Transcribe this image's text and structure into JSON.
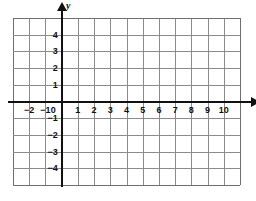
{
  "figure": {
    "kind": "cartesian-coordinate-grid",
    "background_color": "#ffffff",
    "grid_color": "#8b8b8b",
    "axis_color": "#111111"
  },
  "axes": {
    "x_label": "x",
    "y_label": "y",
    "origin_label": "0"
  },
  "chart_data": {
    "type": "scatter",
    "title": "",
    "subtitle": "",
    "xlabel": "x",
    "ylabel": "y",
    "grid": true,
    "legend": "none",
    "xlim": [
      -3,
      11
    ],
    "ylim": [
      -5,
      5
    ],
    "xtick_step": 1,
    "ytick_step": 1,
    "x_tick_labels": [
      "-2",
      "-1",
      "0",
      "1",
      "2",
      "3",
      "4",
      "5",
      "6",
      "7",
      "8",
      "9",
      "10"
    ],
    "x_tick_values": [
      -2,
      -1,
      0,
      1,
      2,
      3,
      4,
      5,
      6,
      7,
      8,
      9,
      10
    ],
    "y_tick_labels": [
      "4",
      "3",
      "2",
      "1",
      "-1",
      "-2",
      "-3",
      "-4"
    ],
    "y_tick_values": [
      4,
      3,
      2,
      1,
      -1,
      -2,
      -3,
      -4
    ],
    "series": [],
    "points": [],
    "annotations": []
  },
  "x_ticks": [
    {
      "label": "-2",
      "value": -2
    },
    {
      "label": "-1",
      "value": -1
    },
    {
      "label": "1",
      "value": 1
    },
    {
      "label": "2",
      "value": 2
    },
    {
      "label": "3",
      "value": 3
    },
    {
      "label": "4",
      "value": 4
    },
    {
      "label": "5",
      "value": 5
    },
    {
      "label": "6",
      "value": 6
    },
    {
      "label": "7",
      "value": 7
    },
    {
      "label": "8",
      "value": 8
    },
    {
      "label": "9",
      "value": 9
    },
    {
      "label": "10",
      "value": 10
    }
  ],
  "y_ticks": [
    {
      "label": "4",
      "value": 4
    },
    {
      "label": "3",
      "value": 3
    },
    {
      "label": "2",
      "value": 2
    },
    {
      "label": "1",
      "value": 1
    },
    {
      "label": "-1",
      "value": -1
    },
    {
      "label": "-2",
      "value": -2
    },
    {
      "label": "-3",
      "value": -3
    },
    {
      "label": "-4",
      "value": -4
    }
  ]
}
